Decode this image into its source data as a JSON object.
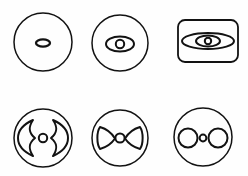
{
  "sheet": {
    "width": 248,
    "height": 176,
    "background_color": "#fefefe",
    "stroke_color": "#121212",
    "style": "black-and-white line art",
    "layout": "2 rows x 3 columns of schematic figures",
    "caption": ""
  },
  "figures": [
    {
      "id": "figure-1",
      "position": "row-1-col-1",
      "outline": "circle",
      "label": "",
      "center": {
        "x": 43,
        "y": 42
      },
      "radius": 29,
      "parts": [
        {
          "name": "central-ellipse",
          "shape": "ellipse",
          "cx": 43,
          "cy": 43,
          "rx": 7,
          "ry": 3.6
        }
      ]
    },
    {
      "id": "figure-2",
      "position": "row-1-col-2",
      "outline": "circle",
      "label": "",
      "center": {
        "x": 120,
        "y": 43
      },
      "radius": 28,
      "parts": [
        {
          "name": "outer-ellipse",
          "shape": "ellipse",
          "cx": 120,
          "cy": 44,
          "rx": 14,
          "ry": 7.5
        },
        {
          "name": "inner-circle",
          "shape": "circle",
          "cx": 120,
          "cy": 44,
          "r": 4.2
        }
      ]
    },
    {
      "id": "figure-3",
      "position": "row-1-col-3",
      "outline": "rounded-rectangle",
      "label": "",
      "rect": {
        "x": 178,
        "y": 20,
        "width": 60,
        "height": 42,
        "rx": 7
      },
      "parts": [
        {
          "name": "outer-ellipse",
          "shape": "ellipse",
          "cx": 208,
          "cy": 41,
          "rx": 26,
          "ry": 8
        },
        {
          "name": "middle-ellipse",
          "shape": "ellipse",
          "cx": 208,
          "cy": 41,
          "rx": 12,
          "ry": 5.5
        },
        {
          "name": "inner-circle",
          "shape": "circle",
          "cx": 208,
          "cy": 41,
          "r": 3.2
        }
      ]
    },
    {
      "id": "figure-4",
      "position": "row-2-col-1",
      "outline": "circle",
      "label": "",
      "center": {
        "x": 43,
        "y": 138
      },
      "radius": 29,
      "parts": [
        {
          "name": "left-wing",
          "shape": "concave-leaf",
          "side": "left"
        },
        {
          "name": "right-wing",
          "shape": "concave-leaf",
          "side": "right"
        },
        {
          "name": "center-circle",
          "shape": "circle",
          "cx": 43,
          "cy": 138,
          "r": 4.2
        }
      ]
    },
    {
      "id": "figure-5",
      "position": "row-2-col-2",
      "outline": "circle",
      "label": "",
      "center": {
        "x": 120,
        "y": 138
      },
      "radius": 28,
      "parts": [
        {
          "name": "left-bowtie-wing",
          "shape": "bowtie-half",
          "side": "left"
        },
        {
          "name": "right-bowtie-wing",
          "shape": "bowtie-half",
          "side": "right"
        },
        {
          "name": "center-circle",
          "shape": "circle",
          "cx": 120,
          "cy": 138,
          "r": 4.6
        }
      ]
    },
    {
      "id": "figure-6",
      "position": "row-2-col-3",
      "outline": "circle",
      "label": "",
      "center": {
        "x": 203,
        "y": 137
      },
      "radius": 29,
      "parts": [
        {
          "name": "left-circle",
          "shape": "circle",
          "cx": 188,
          "cy": 138,
          "r": 9.5
        },
        {
          "name": "center-small-circle",
          "shape": "circle",
          "cx": 203,
          "cy": 138,
          "r": 3.4
        },
        {
          "name": "right-circle",
          "shape": "circle",
          "cx": 218,
          "cy": 138,
          "r": 9.5
        }
      ]
    }
  ]
}
